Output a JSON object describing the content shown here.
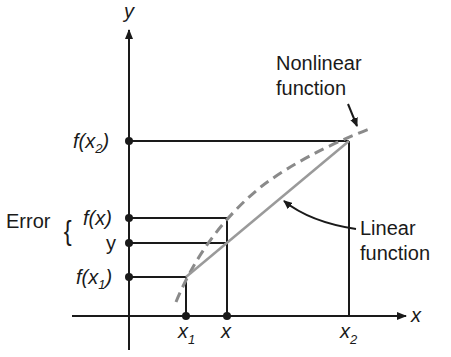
{
  "diagram": {
    "axes": {
      "x_label": "x",
      "y_label": "y"
    },
    "y_ticks": [
      {
        "id": "fx2",
        "text_main": "f(x",
        "text_sub": "2",
        "text_end": ")"
      },
      {
        "id": "fx",
        "text": "f(x)"
      },
      {
        "id": "y",
        "text": "y"
      },
      {
        "id": "fx1",
        "text_main": "f(x",
        "text_sub": "1",
        "text_end": ")"
      }
    ],
    "x_ticks": [
      {
        "id": "x1",
        "text_main": "x",
        "text_sub": "1"
      },
      {
        "id": "x",
        "text": "x"
      },
      {
        "id": "x2",
        "text_main": "x",
        "text_sub": "2"
      }
    ],
    "error_label": "Error",
    "error_brace": "{",
    "nonlinear_label": {
      "line1": "Nonlinear",
      "line2": "function"
    },
    "linear_label": {
      "line1": "Linear",
      "line2": "function"
    },
    "colors": {
      "axes": "#1a1a1a",
      "linear": "#9a9a9a",
      "nonlinear_dashed": "#8a8a8a"
    }
  }
}
